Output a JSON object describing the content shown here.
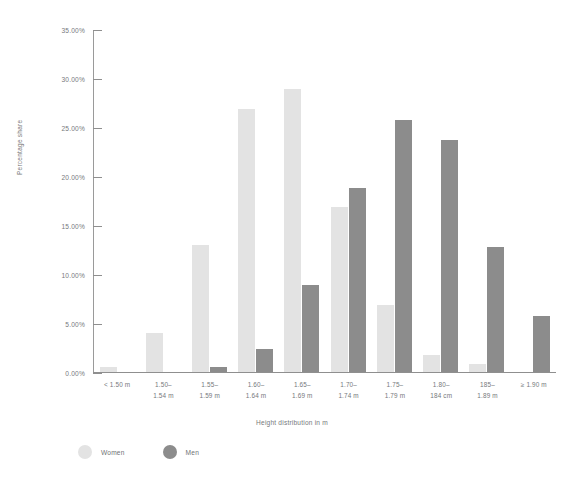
{
  "chart_data": {
    "type": "bar",
    "title": "",
    "xlabel": "Height distribution in m",
    "ylabel": "Percentage share",
    "categories": [
      "< 1.50 m",
      "1.50–\n1.54 m",
      "1.55–\n1.59 m",
      "1.60–\n1.64 m",
      "1.65–\n1.69 m",
      "1.70–\n1.74 m",
      "1.75–\n1.79 m",
      "1.80–\n184 cm",
      "185–\n1.89 m",
      "≥ 1.90 m"
    ],
    "series": [
      {
        "name": "Women",
        "color": "#e3e3e3",
        "values": [
          0.5,
          3.9,
          12.9,
          26.8,
          28.8,
          16.8,
          6.8,
          1.7,
          0.8,
          0.0
        ]
      },
      {
        "name": "Men",
        "color": "#8c8c8c",
        "values": [
          0.0,
          0.0,
          0.5,
          2.3,
          8.8,
          18.7,
          25.7,
          23.6,
          12.7,
          5.7
        ]
      }
    ],
    "ylim": [
      0,
      35
    ],
    "y_tick_labels": [
      "0.00%",
      "5.00%",
      "10.00%",
      "15.00%",
      "20.00%",
      "25.00%",
      "30.00%",
      "35.00%"
    ],
    "y_tick_values": [
      0,
      5,
      10,
      15,
      20,
      25,
      30,
      35
    ],
    "grid": false,
    "legend_position": "bottom-left",
    "axis_color": "#8f8f8f",
    "text_color": "#76797c",
    "background_color": "#ffffff"
  },
  "legend": {
    "items": [
      {
        "label": "Women",
        "color": "#e3e3e3"
      },
      {
        "label": "Men",
        "color": "#8c8c8c"
      }
    ]
  }
}
